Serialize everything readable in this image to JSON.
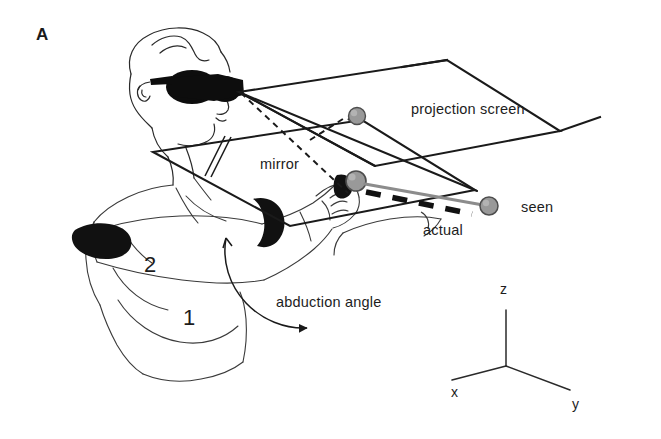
{
  "figure": {
    "panel_label": "A",
    "background_color": "#ffffff",
    "ink_color": "#1a1a1a",
    "sphere_fill": "#999999",
    "sphere_stroke": "#4d4d4d",
    "marker_band_color": "#111111"
  },
  "labels": {
    "projection_screen": "projection screen",
    "mirror": "mirror",
    "seen": "seen",
    "actual": "actual",
    "abduction_angle": "abduction angle"
  },
  "segments": {
    "upper_arm": "2",
    "forearm": "1"
  },
  "axes": {
    "x": "x",
    "y": "y",
    "z": "z"
  }
}
